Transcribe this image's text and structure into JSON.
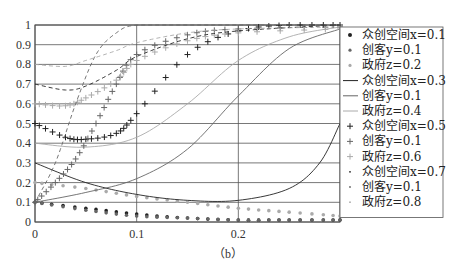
{
  "chart_data": {
    "type": "line",
    "title": "",
    "caption": "（b）",
    "xlabel": "",
    "ylabel": "",
    "xlim": [
      0,
      0.3
    ],
    "ylim": [
      0,
      1
    ],
    "x_ticks": [
      "0",
      "0.1",
      "0.2"
    ],
    "y_ticks": [
      "0",
      "0.1",
      "0.2",
      "0.3",
      "0.4",
      "0.5",
      "0.6",
      "0.7",
      "0.8",
      "0.9",
      "1"
    ],
    "grid": true,
    "legend_position": "right",
    "series": [
      {
        "name": "众创空间x=0.1",
        "group": 1,
        "style": "dot-dark",
        "x": [
          0,
          0.05,
          0.1,
          0.15,
          0.2,
          0.25,
          0.3
        ],
        "values": [
          0.1,
          0.07,
          0.04,
          0.02,
          0.01,
          0.01,
          0.01
        ]
      },
      {
        "name": "创客y=0.1",
        "group": 1,
        "style": "dot-mid",
        "x": [
          0,
          0.05,
          0.1,
          0.15,
          0.2,
          0.25,
          0.3
        ],
        "values": [
          0.1,
          0.06,
          0.03,
          0.02,
          0.01,
          0.01,
          0.01
        ]
      },
      {
        "name": "政府z=0.2",
        "group": 1,
        "style": "dot-light",
        "x": [
          0,
          0.05,
          0.1,
          0.15,
          0.2,
          0.25,
          0.3
        ],
        "values": [
          0.2,
          0.17,
          0.13,
          0.1,
          0.07,
          0.05,
          0.03
        ]
      },
      {
        "name": "众创空间x=0.3",
        "group": 2,
        "style": "solid-dark",
        "x": [
          0,
          0.05,
          0.1,
          0.15,
          0.2,
          0.25,
          0.28,
          0.3
        ],
        "values": [
          0.3,
          0.2,
          0.14,
          0.11,
          0.11,
          0.17,
          0.3,
          0.5
        ]
      },
      {
        "name": "创客y=0.1",
        "group": 2,
        "style": "solid-mid",
        "x": [
          0,
          0.05,
          0.1,
          0.15,
          0.2,
          0.25,
          0.3
        ],
        "values": [
          0.1,
          0.15,
          0.22,
          0.37,
          0.64,
          0.88,
          0.98
        ]
      },
      {
        "name": "政府z=0.4",
        "group": 2,
        "style": "solid-light",
        "x": [
          0,
          0.05,
          0.1,
          0.15,
          0.2,
          0.25,
          0.3
        ],
        "values": [
          0.4,
          0.38,
          0.43,
          0.6,
          0.82,
          0.94,
          0.99
        ]
      },
      {
        "name": "众创空间x=0.5",
        "group": 3,
        "style": "plus-dark",
        "x": [
          0,
          0.03,
          0.05,
          0.08,
          0.1,
          0.15,
          0.2,
          0.25,
          0.3
        ],
        "values": [
          0.5,
          0.43,
          0.42,
          0.45,
          0.55,
          0.85,
          0.97,
          1.0,
          1.0
        ]
      },
      {
        "name": "创客y=0.1",
        "group": 3,
        "style": "plus-mid",
        "x": [
          0,
          0.02,
          0.04,
          0.06,
          0.08,
          0.1,
          0.15,
          0.2,
          0.3
        ],
        "values": [
          0.1,
          0.2,
          0.32,
          0.5,
          0.7,
          0.85,
          0.95,
          0.98,
          0.99
        ]
      },
      {
        "name": "政府z=0.6",
        "group": 3,
        "style": "plus-light",
        "x": [
          0,
          0.03,
          0.05,
          0.08,
          0.1,
          0.15,
          0.2,
          0.3
        ],
        "values": [
          0.6,
          0.59,
          0.63,
          0.72,
          0.82,
          0.92,
          0.96,
          0.98
        ]
      },
      {
        "name": "众创空间x=0.7",
        "group": 4,
        "style": "dash-dark",
        "x": [
          0,
          0.03,
          0.05,
          0.08,
          0.1,
          0.15,
          0.2,
          0.3
        ],
        "values": [
          0.7,
          0.67,
          0.69,
          0.77,
          0.84,
          0.93,
          0.97,
          1.0
        ]
      },
      {
        "name": "创客y=0.1",
        "group": 4,
        "style": "dash-mid",
        "x": [
          0,
          0.02,
          0.04,
          0.06,
          0.08,
          0.1,
          0.15,
          0.3
        ],
        "values": [
          0.1,
          0.3,
          0.6,
          0.85,
          0.96,
          1.0,
          1.0,
          1.0
        ]
      },
      {
        "name": "政府z=0.8",
        "group": 4,
        "style": "dash-light",
        "x": [
          0,
          0.03,
          0.05,
          0.08,
          0.1,
          0.15,
          0.2,
          0.3
        ],
        "values": [
          0.8,
          0.79,
          0.82,
          0.87,
          0.91,
          0.96,
          0.98,
          0.99
        ]
      }
    ]
  }
}
